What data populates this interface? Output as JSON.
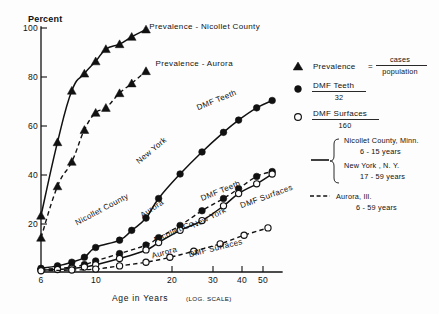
{
  "chart_data": {
    "type": "line",
    "title": "",
    "ylabel": "Percent",
    "xlabel": "Age in Years",
    "xlabel_suffix": "(LOG. SCALE)",
    "x_scale": "log",
    "xlim": [
      6,
      57
    ],
    "ylim": [
      0,
      100
    ],
    "grid": false,
    "xticks": [
      6,
      10,
      20,
      30,
      40,
      50
    ],
    "xtick_labels": [
      "6",
      "10",
      "20",
      "30",
      "40",
      "50"
    ],
    "yticks": [
      20,
      40,
      60,
      80,
      100
    ],
    "ytick_labels": [
      "20",
      "40",
      "60",
      "80",
      "100"
    ],
    "legend_position": "right",
    "series": [
      {
        "name": "Prevalence - Nicollet County",
        "marker": "triangle-filled",
        "line": "solid",
        "x": [
          6,
          7,
          8,
          9,
          10,
          11,
          12.5,
          14,
          16
        ],
        "values": [
          23,
          53,
          74,
          81,
          86,
          91,
          93,
          96,
          99
        ]
      },
      {
        "name": "Prevalence - Aurora",
        "marker": "triangle-filled",
        "line": "dashed",
        "x": [
          6,
          7,
          8,
          9,
          10,
          11,
          12.5,
          14,
          16
        ],
        "values": [
          14,
          35,
          45,
          58,
          65,
          67,
          73,
          77,
          82
        ]
      },
      {
        "name": "DMF Teeth - New York",
        "marker": "circle-filled",
        "line": "solid",
        "x": [
          6,
          7,
          8,
          9,
          10,
          12.5,
          14,
          16,
          18,
          22,
          27,
          33,
          38,
          45,
          52
        ],
        "values": [
          1.5,
          2.5,
          4,
          6,
          10,
          13,
          17,
          22,
          30,
          40,
          49,
          57,
          62,
          67,
          70
        ]
      },
      {
        "name": "DMF Teeth - Aurora",
        "marker": "circle-filled",
        "line": "dashed",
        "x": [
          6,
          7,
          8,
          9,
          10,
          12.5,
          16,
          18,
          22,
          27,
          33,
          38,
          45,
          52
        ],
        "values": [
          1,
          1.5,
          2,
          3,
          4.5,
          7.5,
          11,
          14,
          19,
          25,
          30,
          34,
          39,
          41
        ]
      },
      {
        "name": "DMF Surfaces - New York",
        "marker": "circle-open",
        "line": "solid",
        "x": [
          6,
          7,
          8,
          9,
          10,
          12.5,
          16,
          18,
          22,
          27,
          33,
          38,
          45,
          52
        ],
        "values": [
          0.8,
          1,
          1.5,
          2,
          3,
          5.5,
          9,
          12,
          17,
          21,
          27,
          32,
          36,
          40
        ]
      },
      {
        "name": "DMF Surfaces - Aurora",
        "marker": "circle-open",
        "line": "dashed",
        "x": [
          6,
          8,
          10,
          12.5,
          16,
          20,
          25,
          32,
          40,
          50
        ],
        "values": [
          0.5,
          0.8,
          1.2,
          2.5,
          4,
          6,
          8.5,
          11.5,
          15,
          18
        ]
      }
    ],
    "annotations": [
      {
        "text": "Prevalence - Nicollet County",
        "x": 16.5,
        "y": 99
      },
      {
        "text": "Prevalence - Aurora",
        "x": 17.5,
        "y": 84
      },
      {
        "text": "DMF Teeth",
        "x": 26,
        "y": 66
      },
      {
        "text": "New York",
        "x": 15,
        "y": 44
      },
      {
        "text": "Nicollet County",
        "x": 8.4,
        "y": 19
      },
      {
        "text": "Aurora",
        "x": 15.5,
        "y": 22
      },
      {
        "text": "DMF Teeth",
        "x": 27,
        "y": 29
      },
      {
        "text": "DMF Surfaces",
        "x": 39,
        "y": 26
      },
      {
        "text": "New York",
        "x": 25,
        "y": 18
      },
      {
        "text": "Nicollet Co",
        "x": 17.5,
        "y": 12
      },
      {
        "text": "Aurora",
        "x": 17,
        "y": 5.5
      },
      {
        "text": "DMF Surfaces",
        "x": 24,
        "y": 6
      }
    ]
  },
  "legend": {
    "entries": [
      {
        "marker": "triangle-filled",
        "label": "Prevalence",
        "equals": "=",
        "numerator": "cases",
        "denominator": "population"
      },
      {
        "marker": "circle-filled",
        "label": "DMF  Teeth",
        "value": "32"
      },
      {
        "marker": "circle-open",
        "label": "DMF  Surfaces",
        "value": "160"
      }
    ],
    "line_keys": [
      {
        "style": "solid",
        "lines": [
          "Nicollet  County, Minn.",
          "6 - 15  years",
          "New  York ,  N. Y.",
          "17 - 59  years"
        ]
      },
      {
        "style": "dashed",
        "lines": [
          "Aurora, Ill.",
          "6 - 59  years"
        ]
      }
    ]
  },
  "axes": {
    "y_axis_label": "Percent",
    "x_axis_label": "Age  in  Years",
    "x_axis_label_note": "(LOG. SCALE)"
  }
}
